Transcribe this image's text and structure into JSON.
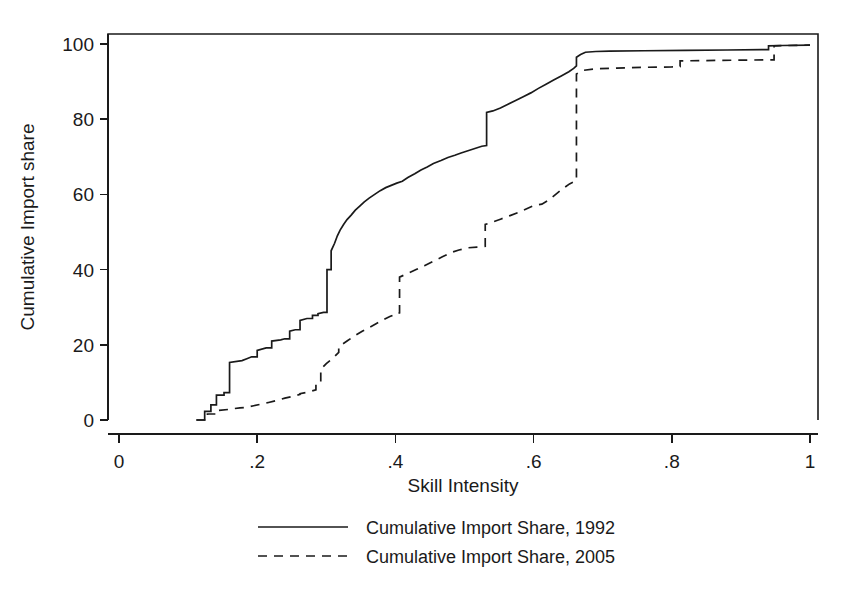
{
  "chart_data": {
    "type": "line",
    "title": "",
    "xlabel": "Skill Intensity",
    "ylabel": "Cumulative Import share",
    "xlim": [
      0,
      1.04
    ],
    "ylim": [
      0,
      104
    ],
    "xticks": [
      "0",
      ".2",
      ".4",
      ".6",
      ".8",
      "1"
    ],
    "xtick_values": [
      0,
      0.2,
      0.4,
      0.6,
      0.8,
      1.0
    ],
    "yticks": [
      "0",
      "20",
      "40",
      "60",
      "80",
      "100"
    ],
    "ytick_values": [
      0,
      20,
      40,
      60,
      80,
      100
    ],
    "grid": false,
    "legend_position": "below-axes",
    "series": [
      {
        "name": "Cumulative Import Share, 1992",
        "style": "solid",
        "color": "#1a1a1a",
        "x": [
          0.112,
          0.124,
          0.124,
          0.133,
          0.133,
          0.141,
          0.141,
          0.152,
          0.152,
          0.16,
          0.16,
          0.178,
          0.185,
          0.192,
          0.2,
          0.2,
          0.213,
          0.221,
          0.221,
          0.234,
          0.24,
          0.247,
          0.247,
          0.255,
          0.262,
          0.262,
          0.272,
          0.28,
          0.28,
          0.288,
          0.288,
          0.296,
          0.301,
          0.301,
          0.307,
          0.307,
          0.312,
          0.316,
          0.32,
          0.325,
          0.33,
          0.336,
          0.342,
          0.348,
          0.355,
          0.362,
          0.37,
          0.378,
          0.386,
          0.394,
          0.402,
          0.41,
          0.418,
          0.428,
          0.437,
          0.446,
          0.455,
          0.466,
          0.476,
          0.486,
          0.495,
          0.505,
          0.515,
          0.525,
          0.532,
          0.532,
          0.541,
          0.552,
          0.563,
          0.574,
          0.585,
          0.596,
          0.607,
          0.618,
          0.629,
          0.64,
          0.651,
          0.658,
          0.662,
          0.662,
          0.668,
          0.675,
          0.69,
          0.71,
          0.76,
          0.82,
          0.88,
          0.93,
          0.94,
          0.94,
          0.96,
          1.0
        ],
        "y": [
          0,
          0,
          2.3,
          2.3,
          4.0,
          4.0,
          6.6,
          6.6,
          7.3,
          7.3,
          15.3,
          15.8,
          16.3,
          16.8,
          16.8,
          18.5,
          19.2,
          19.2,
          21.0,
          21.3,
          21.6,
          21.6,
          23.6,
          24.0,
          24.0,
          26.5,
          27.0,
          27.0,
          27.8,
          27.8,
          28.3,
          28.6,
          28.6,
          40.0,
          40.0,
          45.0,
          47.0,
          49.0,
          50.5,
          52.0,
          53.3,
          54.5,
          55.8,
          56.8,
          58.0,
          59.0,
          60.0,
          61.0,
          61.8,
          62.4,
          63.0,
          63.5,
          64.5,
          65.5,
          66.5,
          67.3,
          68.2,
          69.0,
          69.8,
          70.4,
          71.0,
          71.6,
          72.2,
          72.8,
          73.0,
          81.8,
          82.2,
          83.0,
          84.0,
          85.0,
          86.0,
          87.0,
          88.2,
          89.3,
          90.4,
          91.5,
          92.6,
          93.5,
          94.2,
          96.5,
          97.2,
          97.8,
          98.0,
          98.1,
          98.2,
          98.3,
          98.4,
          98.5,
          98.5,
          99.5,
          99.6,
          99.7
        ],
        "final_value": 99.7
      },
      {
        "name": "Cumulative Import Share, 2005",
        "style": "dashed",
        "color": "#1a1a1a",
        "x": [
          0.112,
          0.128,
          0.128,
          0.142,
          0.142,
          0.158,
          0.165,
          0.175,
          0.185,
          0.195,
          0.205,
          0.215,
          0.228,
          0.24,
          0.252,
          0.262,
          0.262,
          0.275,
          0.285,
          0.285,
          0.292,
          0.292,
          0.3,
          0.31,
          0.318,
          0.318,
          0.33,
          0.342,
          0.352,
          0.362,
          0.372,
          0.382,
          0.392,
          0.398,
          0.398,
          0.406,
          0.406,
          0.418,
          0.43,
          0.442,
          0.455,
          0.468,
          0.48,
          0.492,
          0.505,
          0.518,
          0.53,
          0.53,
          0.54,
          0.552,
          0.565,
          0.578,
          0.59,
          0.6,
          0.612,
          0.622,
          0.632,
          0.642,
          0.652,
          0.66,
          0.662,
          0.662,
          0.672,
          0.69,
          0.72,
          0.76,
          0.8,
          0.812,
          0.812,
          0.85,
          0.9,
          0.94,
          0.948,
          0.948,
          0.97,
          1.0
        ],
        "y": [
          0,
          0,
          1.6,
          1.6,
          2.5,
          2.8,
          3.0,
          3.2,
          3.4,
          3.8,
          4.2,
          4.6,
          5.2,
          5.8,
          6.3,
          6.8,
          7.0,
          7.5,
          8.0,
          9.5,
          9.8,
          13.5,
          15.0,
          16.5,
          18.0,
          19.5,
          21.0,
          22.5,
          23.6,
          24.6,
          25.6,
          26.6,
          27.5,
          28.0,
          28.2,
          28.5,
          38.0,
          39.0,
          40.0,
          41.0,
          42.2,
          43.4,
          44.5,
          45.2,
          45.8,
          46.0,
          46.2,
          52.0,
          52.6,
          53.4,
          54.3,
          55.2,
          56.2,
          57.0,
          57.4,
          58.5,
          60.0,
          61.5,
          62.8,
          63.5,
          63.7,
          92.0,
          93.0,
          93.4,
          93.6,
          93.8,
          93.9,
          94.0,
          95.5,
          95.6,
          95.7,
          95.8,
          95.8,
          99.5,
          99.6,
          99.7
        ],
        "final_value": 99.7
      }
    ],
    "annotations": []
  },
  "legend": {
    "entries": [
      {
        "label": "Cumulative Import Share, 1992",
        "style": "solid"
      },
      {
        "label": "Cumulative Import Share, 2005",
        "style": "dashed"
      }
    ]
  },
  "colors": {
    "ink": "#1a1a1a",
    "background": "#ffffff"
  }
}
